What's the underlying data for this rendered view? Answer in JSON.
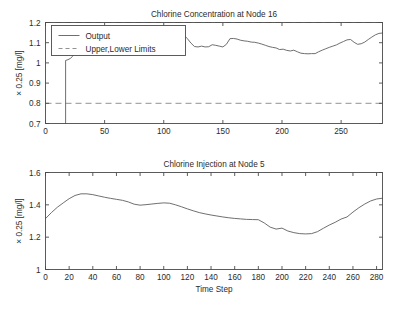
{
  "figure": {
    "background": "#ffffff",
    "line_color": "#555555",
    "limit_color": "#8c8c8c",
    "axis_color": "#4a4a4a",
    "width": 397,
    "height": 315
  },
  "chart_data": [
    {
      "type": "line",
      "id": "chlorine-concentration",
      "title": "Chlorine Concentration at Node 16",
      "xlabel": "",
      "ylabel": "× 0.25 [mg/l]",
      "xlim": [
        0,
        285
      ],
      "ylim": [
        0.7,
        1.2
      ],
      "xticks": [
        0,
        50,
        100,
        150,
        200,
        250
      ],
      "xticklabels": [
        "0",
        "50",
        "100",
        "150",
        "200",
        "250"
      ],
      "yticks": [
        0.7,
        0.8,
        0.9,
        1.0,
        1.1,
        1.2
      ],
      "yticklabels": [
        "0.7",
        "0.8",
        "0.9",
        "1",
        "1.1",
        "1.2"
      ],
      "grid": false,
      "legend_position": "upper left",
      "legend": [
        "Output",
        "Upper,Lower Limits"
      ],
      "annotations": [
        "upper limit 1.2",
        "lower limit 0.8"
      ],
      "limits": {
        "upper": 1.2,
        "lower": 0.8
      },
      "series": [
        {
          "name": "Output",
          "style": "solid",
          "x": [
            17,
            17,
            19,
            21,
            23,
            25,
            27,
            29,
            31,
            33,
            36,
            39,
            42,
            45,
            48,
            51,
            54,
            57,
            60,
            63,
            66,
            69,
            72,
            75,
            78,
            81,
            84,
            87,
            90,
            93,
            96,
            99,
            102,
            105,
            108,
            111,
            114,
            117,
            120,
            123,
            126,
            129,
            132,
            135,
            138,
            141,
            144,
            147,
            150,
            153,
            156,
            159,
            162,
            165,
            168,
            171,
            174,
            177,
            180,
            183,
            186,
            189,
            192,
            195,
            198,
            201,
            204,
            207,
            210,
            213,
            216,
            219,
            222,
            225,
            228,
            231,
            234,
            237,
            240,
            243,
            246,
            249,
            252,
            255,
            258,
            261,
            264,
            267,
            270,
            273,
            276,
            279,
            282,
            285
          ],
          "y": [
            0.7,
            1.012,
            1.016,
            1.022,
            1.033,
            1.046,
            1.048,
            1.05,
            1.052,
            1.055,
            1.06,
            1.063,
            1.07,
            1.072,
            1.07,
            1.066,
            1.069,
            1.073,
            1.078,
            1.081,
            1.083,
            1.086,
            1.09,
            1.1,
            1.098,
            1.103,
            1.104,
            1.112,
            1.108,
            1.112,
            1.116,
            1.118,
            1.125,
            1.131,
            1.141,
            1.153,
            1.156,
            1.138,
            1.12,
            1.098,
            1.081,
            1.079,
            1.083,
            1.079,
            1.08,
            1.09,
            1.087,
            1.083,
            1.079,
            1.092,
            1.12,
            1.121,
            1.118,
            1.112,
            1.109,
            1.107,
            1.103,
            1.102,
            1.098,
            1.093,
            1.087,
            1.081,
            1.077,
            1.074,
            1.066,
            1.068,
            1.062,
            1.059,
            1.063,
            1.055,
            1.048,
            1.046,
            1.045,
            1.046,
            1.046,
            1.055,
            1.063,
            1.07,
            1.077,
            1.083,
            1.089,
            1.098,
            1.106,
            1.114,
            1.116,
            1.102,
            1.092,
            1.095,
            1.103,
            1.116,
            1.128,
            1.139,
            1.146,
            1.148
          ]
        },
        {
          "name": "Upper Limit",
          "style": "dashed",
          "constant": 1.2
        },
        {
          "name": "Lower Limit",
          "style": "dashed",
          "constant": 0.8
        }
      ]
    },
    {
      "type": "line",
      "id": "chlorine-injection",
      "title": "Chlorine Injection at Node 5",
      "xlabel": "Time Step",
      "ylabel": "× 0.25 [mg/l]",
      "xlim": [
        0,
        285
      ],
      "ylim": [
        1.0,
        1.6
      ],
      "xticks": [
        0,
        20,
        40,
        60,
        80,
        100,
        120,
        140,
        160,
        180,
        200,
        220,
        240,
        260,
        280
      ],
      "xticklabels": [
        "0",
        "20",
        "40",
        "60",
        "80",
        "100",
        "120",
        "140",
        "160",
        "180",
        "200",
        "220",
        "240",
        "260",
        "280"
      ],
      "yticks": [
        1.0,
        1.2,
        1.4,
        1.6
      ],
      "yticklabels": [
        "1",
        "1.2",
        "1.4",
        "1.6"
      ],
      "grid": false,
      "legend_position": "none",
      "legend": [],
      "series": [
        {
          "name": "Injection",
          "style": "solid",
          "x": [
            0,
            5,
            10,
            15,
            20,
            25,
            30,
            35,
            40,
            45,
            50,
            55,
            60,
            65,
            70,
            75,
            80,
            85,
            90,
            95,
            100,
            105,
            110,
            115,
            120,
            125,
            130,
            135,
            140,
            145,
            150,
            155,
            160,
            165,
            170,
            175,
            180,
            185,
            190,
            195,
            200,
            205,
            210,
            215,
            220,
            225,
            230,
            235,
            240,
            245,
            250,
            255,
            260,
            265,
            270,
            275,
            280,
            285
          ],
          "y": [
            1.315,
            1.352,
            1.385,
            1.412,
            1.438,
            1.458,
            1.468,
            1.468,
            1.463,
            1.455,
            1.447,
            1.44,
            1.434,
            1.428,
            1.418,
            1.404,
            1.398,
            1.401,
            1.405,
            1.409,
            1.412,
            1.41,
            1.4,
            1.388,
            1.375,
            1.363,
            1.352,
            1.344,
            1.337,
            1.331,
            1.325,
            1.32,
            1.316,
            1.313,
            1.31,
            1.309,
            1.308,
            1.288,
            1.262,
            1.25,
            1.256,
            1.238,
            1.228,
            1.222,
            1.22,
            1.222,
            1.234,
            1.255,
            1.275,
            1.292,
            1.312,
            1.325,
            1.355,
            1.382,
            1.405,
            1.424,
            1.436,
            1.441
          ]
        }
      ]
    }
  ]
}
